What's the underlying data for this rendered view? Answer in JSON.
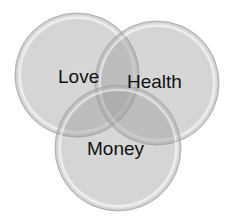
{
  "diagram": {
    "type": "venn",
    "sets": [
      {
        "id": "love",
        "label": "Love",
        "cx": 77,
        "cy": 75,
        "r": 62,
        "label_x": 58,
        "label_y": 83
      },
      {
        "id": "health",
        "label": "Health",
        "cx": 157,
        "cy": 83,
        "r": 62,
        "label_x": 127,
        "label_y": 88
      },
      {
        "id": "money",
        "label": "Money",
        "cx": 118,
        "cy": 148,
        "r": 63,
        "label_x": 87,
        "label_y": 155
      }
    ],
    "colors": {
      "fill": "#8c8c8c",
      "fill_opacity": 0.38,
      "stroke": "#a8a8a8",
      "highlight": "#ffffff",
      "text": "#111111"
    }
  }
}
